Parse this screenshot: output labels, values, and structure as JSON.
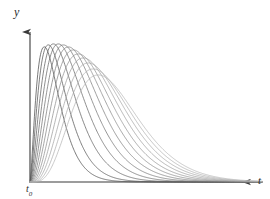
{
  "figure": {
    "background_color": "#ffffff",
    "axis_color": "#3a3a3a",
    "curve_color_dark": "#4a4a4a",
    "curve_color_light": "#b0b0b0"
  },
  "labels": {
    "y_axis": "y",
    "t_axis": "t",
    "t_origin": "t",
    "t_origin_sub": "0"
  },
  "chart_data": {
    "type": "line",
    "title": "",
    "xlabel": "t",
    "ylabel": "y",
    "grid": false,
    "legend": false,
    "xlim": [
      0,
      270
    ],
    "ylim": [
      0,
      199
    ],
    "origin_px": {
      "x": 30,
      "y": 182
    },
    "axis_x_end_px": 256,
    "axis_y_top_px": 24,
    "n_curves": 12,
    "curve_color_start": "#4d4d4d",
    "curve_color_end": "#b5b5b5",
    "series": [
      {
        "name": "curve-1",
        "shape_k": 1.55,
        "peak_x": 44,
        "peak_y": 47,
        "decay": 0.055,
        "color": "#4d4d4d"
      },
      {
        "name": "curve-2",
        "shape_k": 1.7,
        "peak_x": 48,
        "peak_y": 45,
        "decay": 0.052,
        "color": "#565656"
      },
      {
        "name": "curve-3",
        "shape_k": 1.86,
        "peak_x": 53,
        "peak_y": 44,
        "decay": 0.049,
        "color": "#606060"
      },
      {
        "name": "curve-4",
        "shape_k": 2.04,
        "peak_x": 58,
        "peak_y": 44,
        "decay": 0.046,
        "color": "#6a6a6a"
      },
      {
        "name": "curve-5",
        "shape_k": 2.24,
        "peak_x": 63,
        "peak_y": 45,
        "decay": 0.043,
        "color": "#747474"
      },
      {
        "name": "curve-6",
        "shape_k": 2.46,
        "peak_x": 68,
        "peak_y": 47,
        "decay": 0.041,
        "color": "#7e7e7e"
      },
      {
        "name": "curve-7",
        "shape_k": 2.7,
        "peak_x": 73,
        "peak_y": 50,
        "decay": 0.038,
        "color": "#888888"
      },
      {
        "name": "curve-8",
        "shape_k": 2.96,
        "peak_x": 78,
        "peak_y": 54,
        "decay": 0.036,
        "color": "#929292"
      },
      {
        "name": "curve-9",
        "shape_k": 3.24,
        "peak_x": 83,
        "peak_y": 58,
        "decay": 0.034,
        "color": "#9c9c9c"
      },
      {
        "name": "curve-10",
        "shape_k": 3.55,
        "peak_x": 88,
        "peak_y": 63,
        "decay": 0.032,
        "color": "#a5a5a5"
      },
      {
        "name": "curve-11",
        "shape_k": 3.88,
        "peak_x": 93,
        "peak_y": 69,
        "decay": 0.03,
        "color": "#adadad"
      },
      {
        "name": "curve-12",
        "shape_k": 4.24,
        "peak_x": 98,
        "peak_y": 75,
        "decay": 0.028,
        "color": "#b5b5b5"
      }
    ]
  }
}
